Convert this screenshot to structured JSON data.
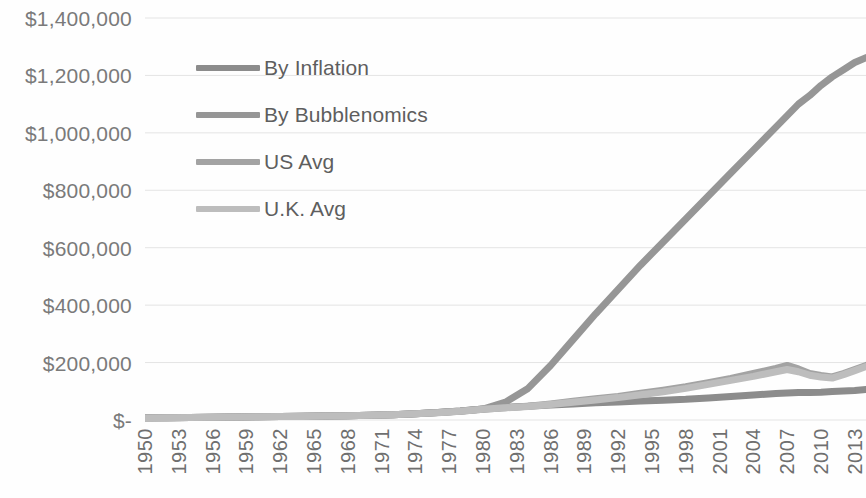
{
  "chart_data": {
    "type": "line",
    "title": "",
    "subtitle": "",
    "xlabel": "",
    "ylabel": "",
    "grid": true,
    "legend_position": "inside-top-left",
    "xlim": [
      1950,
      2014
    ],
    "ylim": [
      0,
      1400000
    ],
    "y_ticks": [
      {
        "value": 1400000,
        "label": "$1,400,000"
      },
      {
        "value": 1200000,
        "label": "$1,200,000"
      },
      {
        "value": 1000000,
        "label": "$1,000,000"
      },
      {
        "value": 800000,
        "label": "$800,000"
      },
      {
        "value": 600000,
        "label": "$600,000"
      },
      {
        "value": 400000,
        "label": "$400,000"
      },
      {
        "value": 200000,
        "label": "$200,000"
      },
      {
        "value": 0,
        "label": "$-"
      }
    ],
    "x_ticks": [
      "1950",
      "1953",
      "1956",
      "1959",
      "1962",
      "1965",
      "1968",
      "1971",
      "1974",
      "1977",
      "1980",
      "1983",
      "1986",
      "1989",
      "1992",
      "1995",
      "1998",
      "2001",
      "2004",
      "2007",
      "2010",
      "2013"
    ],
    "x_tick_values": [
      1950,
      1953,
      1956,
      1959,
      1962,
      1965,
      1968,
      1971,
      1974,
      1977,
      1980,
      1983,
      1986,
      1989,
      1992,
      1995,
      1998,
      2001,
      2004,
      2007,
      2010,
      2013
    ],
    "x": [
      1950,
      1952,
      1954,
      1956,
      1958,
      1960,
      1962,
      1964,
      1966,
      1968,
      1970,
      1972,
      1974,
      1976,
      1978,
      1980,
      1982,
      1984,
      1986,
      1988,
      1990,
      1992,
      1994,
      1996,
      1998,
      2000,
      2002,
      2004,
      2006,
      2007,
      2008,
      2009,
      2010,
      2011,
      2012,
      2013,
      2014
    ],
    "series": [
      {
        "name": "By Inflation",
        "color": "#8c8c8c",
        "width": 7,
        "values": [
          7500,
          8200,
          9000,
          9800,
          10500,
          11200,
          12000,
          12800,
          13800,
          15000,
          16800,
          18500,
          22000,
          26000,
          31000,
          38000,
          44000,
          48000,
          52000,
          56000,
          60000,
          63000,
          66000,
          69000,
          72000,
          77000,
          82000,
          87000,
          92000,
          94000,
          96000,
          96000,
          97000,
          99000,
          101000,
          103000,
          106000
        ]
      },
      {
        "name": "By Bubblenomics",
        "color": "#969696",
        "width": 7,
        "values": [
          7500,
          8200,
          9000,
          9800,
          10500,
          11200,
          12000,
          12800,
          13800,
          15000,
          16800,
          18500,
          22000,
          26000,
          31000,
          38000,
          62000,
          110000,
          190000,
          280000,
          370000,
          455000,
          540000,
          620000,
          700000,
          780000,
          860000,
          940000,
          1020000,
          1060000,
          1100000,
          1130000,
          1165000,
          1195000,
          1220000,
          1245000,
          1262000
        ]
      },
      {
        "name": "US Avg",
        "color": "#a3a3a3",
        "width": 7,
        "values": [
          7400,
          8100,
          8900,
          9700,
          10400,
          11100,
          11900,
          12700,
          13700,
          14900,
          16700,
          18400,
          21800,
          25800,
          30800,
          37800,
          43000,
          48000,
          56000,
          65000,
          74000,
          82000,
          93000,
          104000,
          116000,
          130000,
          145000,
          162000,
          180000,
          190000,
          178000,
          162000,
          155000,
          150000,
          162000,
          176000,
          190000
        ]
      },
      {
        "name": "U.K. Avg",
        "color": "#bdbdbd",
        "width": 7,
        "values": [
          7300,
          8000,
          8800,
          9600,
          10300,
          11000,
          11800,
          12600,
          13600,
          14800,
          16600,
          18300,
          21600,
          25600,
          30600,
          37500,
          42500,
          47000,
          54000,
          62000,
          70000,
          78000,
          88000,
          98000,
          110000,
          124000,
          138000,
          152000,
          168000,
          176000,
          168000,
          156000,
          150000,
          146000,
          158000,
          172000,
          186000
        ]
      }
    ]
  },
  "legend": {
    "items": [
      {
        "label": "By Inflation",
        "color": "#8c8c8c"
      },
      {
        "label": "By Bubblenomics",
        "color": "#969696"
      },
      {
        "label": "US Avg",
        "color": "#a3a3a3"
      },
      {
        "label": "U.K. Avg",
        "color": "#bdbdbd"
      }
    ]
  },
  "style": {
    "gridline_color": "#e4e4e4",
    "background": "#fefefe",
    "tick_label_color": "#6f6f6f"
  }
}
